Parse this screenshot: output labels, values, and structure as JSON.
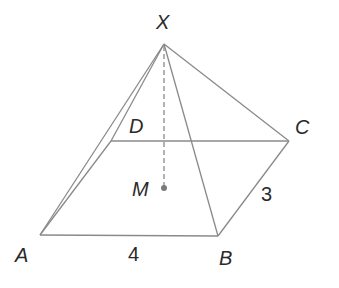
{
  "figure": {
    "type": "rectangular pyramid",
    "vertices": {
      "X": {
        "label": "X",
        "x": 164,
        "y": 44
      },
      "A": {
        "label": "A",
        "x": 40,
        "y": 235
      },
      "B": {
        "label": "B",
        "x": 218,
        "y": 236
      },
      "C": {
        "label": "C",
        "x": 289,
        "y": 141
      },
      "D": {
        "label": "D",
        "x": 111,
        "y": 141
      },
      "M": {
        "label": "M",
        "x": 164,
        "y": 188
      }
    },
    "edges": [
      "AB",
      "BC",
      "CD",
      "DA",
      "XA",
      "XB",
      "XC",
      "XD"
    ],
    "dashed": [
      "XM"
    ],
    "measurements": {
      "AB": "4",
      "BC": "3"
    },
    "line_color": "#8a8a8a",
    "text_color": "#2a2a2a"
  }
}
